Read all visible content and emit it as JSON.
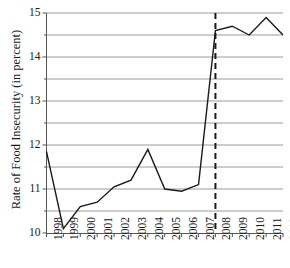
{
  "figure": {
    "partial_title": "",
    "background_color": "#ffffff",
    "line_color": "#1a1a1a",
    "gridline_color": "#9a9a9a",
    "axis_color": "#555555",
    "annotation_color": "#1a1a1a"
  },
  "chart_data": {
    "type": "line",
    "title": "",
    "xlabel": "",
    "ylabel": "Rate of Food Insecurity (in percent)",
    "x": [
      1998,
      1999,
      2000,
      2001,
      2002,
      2003,
      2004,
      2005,
      2006,
      2007,
      2008,
      2009,
      2010,
      2011,
      2012
    ],
    "categories": [
      "1998",
      "1999",
      "2000",
      "2001",
      "2002",
      "2003",
      "2004",
      "2005",
      "2006",
      "2007",
      "2008",
      "2009",
      "2010",
      "2011",
      "2012"
    ],
    "values": [
      11.85,
      10.1,
      10.6,
      10.7,
      11.05,
      11.2,
      11.9,
      11.0,
      10.95,
      11.1,
      14.6,
      14.7,
      14.5,
      14.9,
      14.5
    ],
    "series": [
      {
        "name": "Rate of Food Insecurity",
        "values": [
          11.85,
          10.1,
          10.6,
          10.7,
          11.05,
          11.2,
          11.9,
          11.0,
          10.95,
          11.1,
          14.6,
          14.7,
          14.5,
          14.9,
          14.5
        ]
      }
    ],
    "ylim": [
      10,
      15
    ],
    "xlim": [
      1998,
      2012
    ],
    "ymajor_ticks": [
      10,
      11,
      12,
      13,
      14,
      15
    ],
    "ytick_labels": [
      "10",
      "11",
      "12",
      "13",
      "14",
      "15"
    ],
    "yminor_ticks": [
      10.5,
      11.5,
      12.5,
      13.5,
      14.5
    ],
    "gridlines": [
      10.5,
      11,
      11.5,
      12,
      12.5,
      13,
      13.5,
      14,
      14.5,
      15
    ],
    "grid": true,
    "legend": null,
    "legend_position": "none",
    "annotations": [
      {
        "type": "vline",
        "x": 2008,
        "style": "dashed",
        "label": ""
      }
    ]
  }
}
